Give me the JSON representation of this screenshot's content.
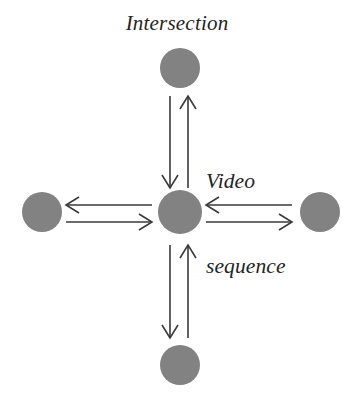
{
  "figure": {
    "type": "node-link-diagram",
    "title": "Intersection",
    "annotation_lines": [
      "Video",
      "sequence"
    ],
    "annotation_text": "Video sequence",
    "background_color": "#ffffff",
    "node_color": "#828282",
    "arrow_color": "#3a3a3a",
    "text_color": "#242424"
  },
  "nodes": [
    {
      "id": "center",
      "name": "intersection-node-center",
      "cx": 180,
      "cy": 212,
      "r": 22,
      "label": ""
    },
    {
      "id": "north",
      "name": "intersection-node-north",
      "cx": 180,
      "cy": 68,
      "r": 20,
      "label": ""
    },
    {
      "id": "south",
      "name": "intersection-node-south",
      "cx": 180,
      "cy": 365,
      "r": 20,
      "label": ""
    },
    {
      "id": "west",
      "name": "intersection-node-west",
      "cx": 42,
      "cy": 212,
      "r": 20,
      "label": ""
    },
    {
      "id": "east",
      "name": "intersection-node-east",
      "cx": 320,
      "cy": 212,
      "r": 20,
      "label": ""
    }
  ],
  "arrows": [
    {
      "id": "north-outbound",
      "name": "arrow-center-to-north-down",
      "from": "north",
      "to": "center",
      "direction": "down",
      "x1": 170,
      "y1": 96,
      "x2": 170,
      "y2": 188
    },
    {
      "id": "north-inbound",
      "name": "arrow-north-to-center-up",
      "from": "center",
      "to": "north",
      "direction": "up",
      "x1": 188,
      "y1": 188,
      "x2": 188,
      "y2": 96
    },
    {
      "id": "south-outbound",
      "name": "arrow-center-to-south-down",
      "from": "center",
      "to": "south",
      "direction": "down",
      "x1": 170,
      "y1": 245,
      "x2": 170,
      "y2": 338
    },
    {
      "id": "south-inbound",
      "name": "arrow-south-to-center-up",
      "from": "south",
      "to": "center",
      "direction": "up",
      "x1": 188,
      "y1": 338,
      "x2": 188,
      "y2": 245
    },
    {
      "id": "west-outbound",
      "name": "arrow-center-to-west-left",
      "from": "center",
      "to": "west",
      "direction": "left",
      "x1": 152,
      "y1": 205,
      "x2": 66,
      "y2": 205
    },
    {
      "id": "west-inbound",
      "name": "arrow-west-to-center-right",
      "from": "west",
      "to": "center",
      "direction": "right",
      "x1": 66,
      "y1": 222,
      "x2": 152,
      "y2": 222
    },
    {
      "id": "east-inbound",
      "name": "arrow-east-to-center-left",
      "from": "east",
      "to": "center",
      "direction": "left",
      "x1": 292,
      "y1": 205,
      "x2": 206,
      "y2": 205
    },
    {
      "id": "east-outbound",
      "name": "arrow-center-to-east-right",
      "from": "center",
      "to": "east",
      "direction": "right",
      "x1": 206,
      "y1": 222,
      "x2": 292,
      "y2": 222
    }
  ]
}
